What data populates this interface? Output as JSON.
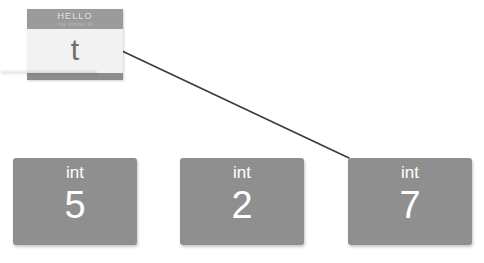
{
  "canvas": {
    "width": 484,
    "height": 263,
    "background_color": "#ffffff"
  },
  "name_tag": {
    "header_primary": "HELLO",
    "header_secondary": "my name is",
    "value": "t",
    "header_color": "#9b9b9b",
    "body_color": "#f2f2f2",
    "edge_color": "#8d8d8d",
    "value_color": "#6e6e6e"
  },
  "connector": {
    "name": "reference-arrow",
    "from": "name-tag",
    "to": "int-box-2",
    "x1": 122,
    "y1": 51,
    "x2": 349,
    "y2": 158,
    "color": "#3a3a3a",
    "width": 1.6
  },
  "boxes": [
    {
      "type": "int",
      "value": "5",
      "fill": "#8f8f8f",
      "text_color": "#ffffff"
    },
    {
      "type": "int",
      "value": "2",
      "fill": "#8f8f8f",
      "text_color": "#ffffff"
    },
    {
      "type": "int",
      "value": "7",
      "fill": "#8f8f8f",
      "text_color": "#ffffff"
    }
  ]
}
